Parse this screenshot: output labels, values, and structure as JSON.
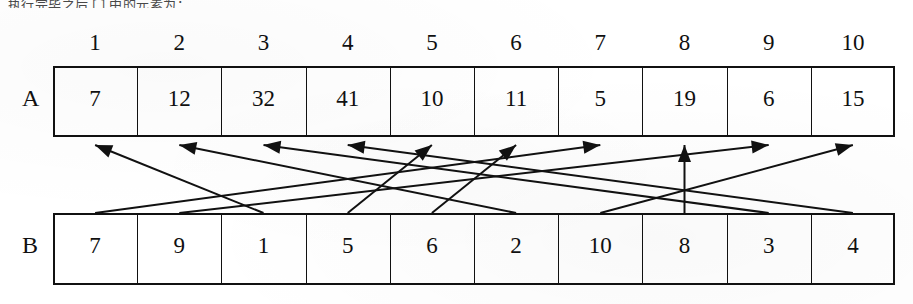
{
  "page": {
    "clipped_top_text": ", 执行完毕之后 [ ] 中的元素为：",
    "bg_color": "#ffffff",
    "ink_color": "#111111"
  },
  "column_headers": [
    "1",
    "2",
    "3",
    "4",
    "5",
    "6",
    "7",
    "8",
    "9",
    "10"
  ],
  "arrays": [
    {
      "label": "A",
      "name": "array-a",
      "values": [
        "7",
        "12",
        "32",
        "41",
        "10",
        "11",
        "5",
        "19",
        "6",
        "15"
      ]
    },
    {
      "label": "B",
      "name": "array-b",
      "values": [
        "7",
        "9",
        "1",
        "5",
        "6",
        "2",
        "10",
        "8",
        "3",
        "4"
      ]
    }
  ],
  "mappings": [
    {
      "from_index": 1,
      "to_index": 7,
      "from_value": "7",
      "label": "b1-to-a7"
    },
    {
      "from_index": 2,
      "to_index": 9,
      "from_value": "9",
      "label": "b2-to-a9"
    },
    {
      "from_index": 3,
      "to_index": 1,
      "from_value": "1",
      "label": "b3-to-a1"
    },
    {
      "from_index": 4,
      "to_index": 5,
      "from_value": "5",
      "label": "b4-to-a5"
    },
    {
      "from_index": 5,
      "to_index": 6,
      "from_value": "6",
      "label": "b5-to-a6"
    },
    {
      "from_index": 6,
      "to_index": 2,
      "from_value": "2",
      "label": "b6-to-a2"
    },
    {
      "from_index": 7,
      "to_index": 10,
      "from_value": "10",
      "label": "b7-to-a10"
    },
    {
      "from_index": 8,
      "to_index": 8,
      "from_value": "8",
      "label": "b8-to-a8"
    },
    {
      "from_index": 9,
      "to_index": 3,
      "from_value": "3",
      "label": "b9-to-a3"
    },
    {
      "from_index": 10,
      "to_index": 4,
      "from_value": "4",
      "label": "b10-to-a4"
    }
  ],
  "geometry": {
    "table_left": 53,
    "table_right": 895,
    "cell_width": 84.2,
    "header_y": 30,
    "row_a_top": 66,
    "row_a_bottom": 137,
    "row_b_top": 213,
    "row_b_bottom": 285,
    "label_a_x": 22,
    "label_b_x": 22
  }
}
